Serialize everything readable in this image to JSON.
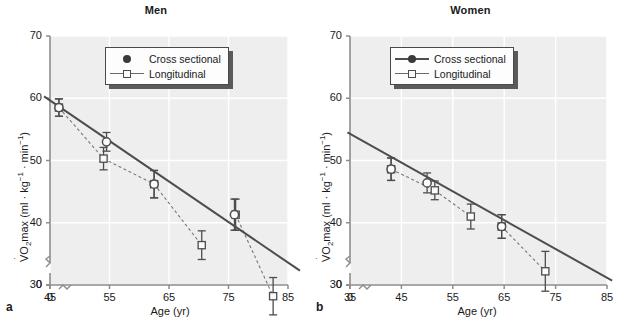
{
  "figure": {
    "xlabel": "Age (yr)",
    "ylabel_prefix": "VO",
    "ylabel_sub": "2",
    "ylabel_mid": "max (ml · kg",
    "ylabel_sup1": "−1",
    "ylabel_mid2": " · min",
    "ylabel_sup2": "−1",
    "ylabel_end": ")",
    "ylabel_full": "V̇O2max (ml · kg−1 · min−1)"
  },
  "legend": {
    "cross_sectional": "Cross sectional",
    "longitudinal": "Longitudinal"
  },
  "panels": [
    {
      "letter": "a",
      "title": "Men"
    },
    {
      "letter": "b",
      "title": "Women"
    }
  ],
  "chart_data": [
    {
      "type": "scatter",
      "title": "Men",
      "panel_letter": "a",
      "xlabel": "Age (yr)",
      "ylabel": "VO2max (ml · kg-1 · min-1)",
      "xlim": [
        45,
        85
      ],
      "ylim": [
        30,
        70
      ],
      "y_axis_break": true,
      "y_break_from": 0,
      "y_break_to": 30,
      "x_axis_break": true,
      "xticks": [
        0,
        45,
        55,
        65,
        75,
        85
      ],
      "yticks": [
        0,
        30,
        40,
        50,
        60,
        70
      ],
      "grid": true,
      "legend_position": "top-center",
      "series": [
        {
          "name": "Cross sectional",
          "marker": "circle-open",
          "line": "solid",
          "fit_line": {
            "x": [
              44,
              87
            ],
            "y": [
              60.3,
              32.3
            ]
          },
          "x": [
            46.5,
            54.5,
            62.5,
            76.0
          ],
          "y": [
            58.5,
            53.0,
            46.2,
            41.3
          ],
          "yerr": [
            1.4,
            1.5,
            2.2,
            2.5
          ]
        },
        {
          "name": "Longitudinal",
          "marker": "square-open",
          "line": "dashed",
          "x": [
            46.5,
            54.0,
            62.5,
            70.5,
            76.2,
            82.5
          ],
          "y": [
            58.5,
            50.3,
            46.2,
            36.4,
            41.3,
            28.2
          ],
          "yerr": [
            1.4,
            1.8,
            2.2,
            2.3,
            2.5,
            3.0
          ],
          "segments": [
            {
              "x": [
                46.5,
                54.0
              ],
              "y": [
                58.5,
                50.3
              ]
            },
            {
              "x": [
                54.0,
                62.5
              ],
              "y": [
                50.3,
                46.2
              ]
            },
            {
              "x": [
                62.5,
                70.5
              ],
              "y": [
                46.2,
                36.4
              ]
            },
            {
              "x": [
                76.2,
                82.5
              ],
              "y": [
                41.3,
                28.2
              ]
            }
          ]
        }
      ]
    },
    {
      "type": "scatter",
      "title": "Women",
      "panel_letter": "b",
      "xlabel": "Age (yr)",
      "ylabel": "VO2max (ml · kg-1 · min-1)",
      "xlim": [
        35,
        85
      ],
      "ylim": [
        30,
        70
      ],
      "y_axis_break": true,
      "y_break_from": 0,
      "y_break_to": 30,
      "x_axis_break": true,
      "xticks": [
        0,
        35,
        45,
        55,
        65,
        75,
        85
      ],
      "yticks": [
        0,
        30,
        40,
        50,
        60,
        70
      ],
      "grid": true,
      "legend_position": "top-center",
      "series": [
        {
          "name": "Cross sectional",
          "marker": "circle-open",
          "line": "solid",
          "fit_line": {
            "x": [
              34.5,
              86
            ],
            "y": [
              54.5,
              30.7
            ]
          },
          "x": [
            43.0,
            50.0,
            64.5
          ],
          "y": [
            48.6,
            46.4,
            39.4
          ],
          "yerr": [
            1.8,
            1.6,
            1.9
          ]
        },
        {
          "name": "Longitudinal",
          "marker": "square-open",
          "line": "dashed",
          "x": [
            43.0,
            51.5,
            58.5,
            64.5,
            73.0
          ],
          "y": [
            48.6,
            45.2,
            41.0,
            39.4,
            32.2
          ],
          "yerr": [
            1.8,
            1.5,
            2.0,
            1.9,
            3.2
          ],
          "segments": [
            {
              "x": [
                43.0,
                51.5
              ],
              "y": [
                48.6,
                45.2
              ]
            },
            {
              "x": [
                51.5,
                58.5
              ],
              "y": [
                45.2,
                41.0
              ]
            },
            {
              "x": [
                64.5,
                73.0
              ],
              "y": [
                39.4,
                32.2
              ]
            }
          ]
        }
      ]
    }
  ]
}
